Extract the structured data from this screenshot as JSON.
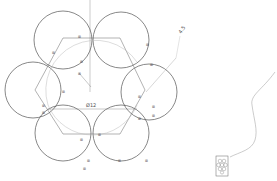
{
  "sketch": {
    "dimensions": {
      "diameter_label": "Ø12",
      "offset_label": "4.5"
    },
    "relation_tag": "⊞",
    "colors": {
      "line": "#555555",
      "construction": "#999999",
      "background": "#ffffff"
    }
  }
}
